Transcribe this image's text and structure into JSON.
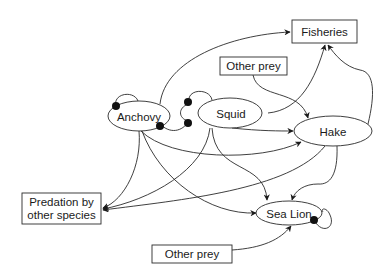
{
  "diagram": {
    "type": "food-web interaction diagram",
    "nodes": {
      "fisheries": {
        "label": "Fisheries",
        "shape": "box"
      },
      "other_prey_top": {
        "label": "Other prey",
        "shape": "box"
      },
      "anchovy": {
        "label": "Anchovy",
        "shape": "ellipse"
      },
      "squid": {
        "label": "Squid",
        "shape": "ellipse"
      },
      "hake": {
        "label": "Hake",
        "shape": "ellipse"
      },
      "predation": {
        "label_line1": "Predation by",
        "label_line2": "other species",
        "shape": "box"
      },
      "sea_lion": {
        "label": "Sea Lion",
        "shape": "ellipse"
      },
      "other_prey_bottom": {
        "label": "Other prey",
        "shape": "box"
      }
    },
    "edges": [
      {
        "from": "Anchovy",
        "to": "Fisheries",
        "type": "arrow"
      },
      {
        "from": "Squid",
        "to": "Fisheries",
        "type": "arrow"
      },
      {
        "from": "Hake",
        "to": "Fisheries",
        "type": "arrow"
      },
      {
        "from": "Other prey",
        "to": "Hake",
        "type": "arrow"
      },
      {
        "from": "Squid",
        "to": "Hake",
        "type": "arrow"
      },
      {
        "from": "Anchovy",
        "to": "Hake",
        "type": "arrow"
      },
      {
        "from": "Anchovy",
        "to": "Predation by other species",
        "type": "arrow"
      },
      {
        "from": "Squid",
        "to": "Predation by other species",
        "type": "arrow"
      },
      {
        "from": "Hake",
        "to": "Predation by other species",
        "type": "arrow"
      },
      {
        "from": "Anchovy",
        "to": "Sea Lion",
        "type": "arrow"
      },
      {
        "from": "Squid",
        "to": "Sea Lion",
        "type": "arrow"
      },
      {
        "from": "Hake",
        "to": "Sea Lion",
        "type": "arrow"
      },
      {
        "from": "Other prey",
        "to": "Sea Lion",
        "type": "arrow"
      },
      {
        "from": "Anchovy",
        "to": "Anchovy",
        "type": "self-limiting (dot)"
      },
      {
        "from": "Squid",
        "to": "Squid",
        "type": "self-limiting (dot)"
      },
      {
        "from": "Sea Lion",
        "to": "Sea Lion",
        "type": "self-limiting (dot)"
      },
      {
        "from": "Anchovy",
        "to": "Squid",
        "type": "mutual negative (dots)"
      }
    ],
    "colors": {
      "line": "#2a2a2a",
      "background": "#ffffff",
      "text": "#1a1a1a"
    }
  }
}
